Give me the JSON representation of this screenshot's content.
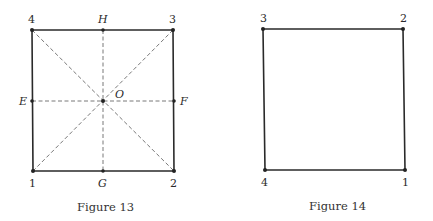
{
  "figures": [
    {
      "caption": "Figure 13",
      "vertices": {
        "v1": {
          "label": "1"
        },
        "v2": {
          "label": "2"
        },
        "v3": {
          "label": "3"
        },
        "v4": {
          "label": "4"
        }
      },
      "midpoints": {
        "E": {
          "label": "E"
        },
        "F": {
          "label": "F"
        },
        "G": {
          "label": "G"
        },
        "H": {
          "label": "H"
        }
      },
      "center": {
        "label": "O"
      },
      "note": "Square with dashed diagonals and dashed midlines through center O"
    },
    {
      "caption": "Figure 14",
      "vertices": {
        "v1": {
          "label": "1"
        },
        "v2": {
          "label": "2"
        },
        "v3": {
          "label": "3"
        },
        "v4": {
          "label": "4"
        }
      },
      "note": "Square with relabeled vertices"
    }
  ],
  "colors": {
    "line": "#2a2a2a",
    "dashed": "#555555",
    "background": "#ffffff"
  }
}
